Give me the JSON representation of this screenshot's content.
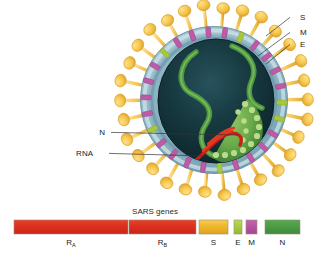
{
  "figure": {
    "background_color": "#ffffff"
  },
  "virion": {
    "name": "SARS coronavirus particle",
    "center": {
      "x": 214,
      "y": 100
    },
    "envelope_radius": 74,
    "core_color": "#15323a",
    "envelope_color": "#9fc3cf",
    "spike_color": "#f3c24b",
    "spike_count": 30,
    "callouts": [
      {
        "id": "S",
        "label": "S",
        "text_x": 300,
        "text_y": 20,
        "anchor_x": 266,
        "anchor_y": 36
      },
      {
        "id": "M",
        "label": "M",
        "text_x": 300,
        "text_y": 35,
        "anchor_x": 258,
        "anchor_y": 56
      },
      {
        "id": "E",
        "label": "E",
        "text_x": 300,
        "text_y": 47,
        "anchor_x": 266,
        "anchor_y": 64
      },
      {
        "id": "N",
        "label": "N",
        "text_x": 105,
        "text_y": 135,
        "anchor_x": 238,
        "anchor_y": 135
      },
      {
        "id": "RNA",
        "label": "RNA",
        "text_x": 93,
        "text_y": 156,
        "anchor_x": 205,
        "anchor_y": 156
      }
    ]
  },
  "gene_map": {
    "title": "SARS genes",
    "title_x": 155,
    "title_y": 214,
    "bar_top": 220,
    "bar_height": 14,
    "label_y": 245,
    "segments": [
      {
        "id": "RA",
        "label": "R",
        "subscript": "A",
        "x": 14,
        "width": 114,
        "color": "#e03223"
      },
      {
        "id": "RB",
        "label": "R",
        "subscript": "B",
        "x": 129,
        "width": 67,
        "color": "#e03223"
      },
      {
        "id": "S",
        "label": "S",
        "subscript": "",
        "x": 199,
        "width": 29,
        "color": "#f0b429"
      },
      {
        "id": "E",
        "label": "E",
        "subscript": "",
        "x": 234,
        "width": 8,
        "color": "#a8c83c"
      },
      {
        "id": "M",
        "label": "M",
        "subscript": "",
        "x": 246,
        "width": 11,
        "color": "#b9529f"
      },
      {
        "id": "N",
        "label": "N",
        "subscript": "",
        "x": 265,
        "width": 35,
        "color": "#4a9b48"
      }
    ]
  },
  "chart_data": {
    "type": "bar",
    "title": "SARS genes",
    "xlabel": "",
    "ylabel": "",
    "orientation": "horizontal-genome-map",
    "categories": [
      "R_A",
      "R_B",
      "S",
      "E",
      "M",
      "N"
    ],
    "values": [
      114,
      67,
      29,
      8,
      11,
      35
    ],
    "value_unit": "relative genome length (px)",
    "colors": [
      "#e03223",
      "#e03223",
      "#f0b429",
      "#a8c83c",
      "#b9529f",
      "#4a9b48"
    ],
    "legend": "inline labels below each segment",
    "grid": false
  }
}
